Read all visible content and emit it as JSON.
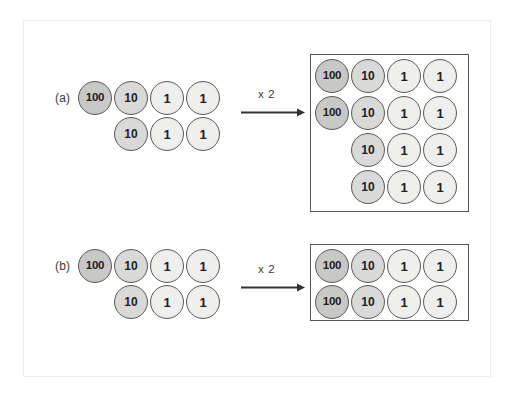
{
  "figure": {
    "colors": {
      "disc_one_fill": "#efefee",
      "disc_ten_fill": "#d9d9d7",
      "disc_hundred_fill": "#c8c8c6",
      "disc_stroke": "#5e5e5e",
      "box_stroke": "#555555",
      "frame_stroke": "#ececed",
      "text": "#20201f",
      "background": "#ffffff"
    }
  },
  "parts": [
    {
      "label": "(a)",
      "operator_label": "x 2",
      "input": {
        "rows": [
          [
            "100",
            "10",
            "1",
            "1"
          ],
          [
            null,
            "10",
            "1",
            "1"
          ]
        ]
      },
      "output": {
        "rows": [
          [
            "100",
            "10",
            "1",
            "1"
          ],
          [
            "100",
            "10",
            "1",
            "1"
          ],
          [
            null,
            "10",
            "1",
            "1"
          ],
          [
            null,
            "10",
            "1",
            "1"
          ]
        ]
      }
    },
    {
      "label": "(b)",
      "operator_label": "x 2",
      "input": {
        "rows": [
          [
            "100",
            "10",
            "1",
            "1"
          ],
          [
            null,
            "10",
            "1",
            "1"
          ]
        ]
      },
      "output": {
        "rows": [
          [
            "100",
            "10",
            "1",
            "1"
          ],
          [
            "100",
            "10",
            "1",
            "1"
          ]
        ]
      }
    }
  ]
}
